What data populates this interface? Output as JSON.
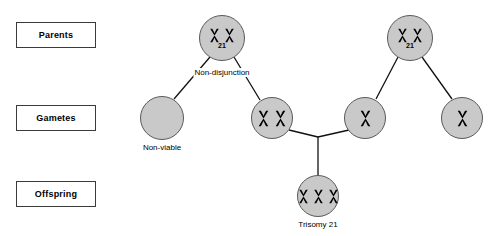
{
  "diagram": {
    "colors": {
      "cell_fill": "#c9c9c9",
      "cell_stroke": "#5a5a5a",
      "line": "#111111",
      "box_border": "#3a3a3a",
      "text": "#000000",
      "background": "#ffffff"
    },
    "row_labels": [
      {
        "id": "parents",
        "label": "Parents",
        "x": 16,
        "y": 22,
        "w": 80,
        "h": 26
      },
      {
        "id": "gametes",
        "label": "Gametes",
        "x": 16,
        "y": 105,
        "w": 80,
        "h": 26
      },
      {
        "id": "offspring",
        "label": "Offspring",
        "x": 16,
        "y": 181,
        "w": 80,
        "h": 26
      }
    ],
    "nodes": [
      {
        "id": "parent-left",
        "row": "parents",
        "chromosomes": 2,
        "number": "21",
        "caption": "",
        "cx": 222,
        "cy": 38,
        "r": 23,
        "chromo_size": 15
      },
      {
        "id": "parent-right",
        "row": "parents",
        "chromosomes": 2,
        "number": "21",
        "caption": "",
        "cx": 410,
        "cy": 38,
        "r": 23,
        "chromo_size": 15
      },
      {
        "id": "gamete-non-viable",
        "row": "gametes",
        "chromosomes": 0,
        "number": "",
        "caption": "Non-viable",
        "cx": 162,
        "cy": 118,
        "r": 22,
        "chromo_size": 15
      },
      {
        "id": "gamete-disomic",
        "row": "gametes",
        "chromosomes": 2,
        "number": "",
        "caption": "",
        "cx": 272,
        "cy": 118,
        "r": 21,
        "chromo_size": 17
      },
      {
        "id": "gamete-normal-inner",
        "row": "gametes",
        "chromosomes": 1,
        "number": "",
        "caption": "",
        "cx": 365,
        "cy": 118,
        "r": 21,
        "chromo_size": 17
      },
      {
        "id": "gamete-normal-outer",
        "row": "gametes",
        "chromosomes": 1,
        "number": "",
        "caption": "",
        "cx": 462,
        "cy": 118,
        "r": 21,
        "chromo_size": 17
      },
      {
        "id": "offspring-trisomy",
        "row": "offspring",
        "chromosomes": 3,
        "number": "",
        "caption": "Trisomy 21",
        "cx": 318,
        "cy": 196,
        "r": 21,
        "chromo_size": 15
      }
    ],
    "annotations": [
      {
        "id": "non-disjunction",
        "text": "Non-disjunction",
        "cx": 222,
        "cy": 73
      }
    ],
    "captions": [
      {
        "id": "non-viable-caption",
        "text": "Non-viable",
        "cx": 162,
        "cy": 148
      },
      {
        "id": "trisomy-caption",
        "text": "Trisomy 21",
        "cx": 318,
        "cy": 225
      }
    ],
    "edges": [
      {
        "id": "parent-left-to-non-viable",
        "x1": 210,
        "y1": 57,
        "x2": 174,
        "y2": 99
      },
      {
        "id": "parent-left-to-disomic",
        "x1": 234,
        "y1": 57,
        "x2": 260,
        "y2": 100
      },
      {
        "id": "parent-right-to-inner-gamete",
        "x1": 398,
        "y1": 57,
        "x2": 376,
        "y2": 99
      },
      {
        "id": "parent-right-to-outer-gamete",
        "x1": 422,
        "y1": 57,
        "x2": 452,
        "y2": 99
      },
      {
        "id": "disomic-to-junction",
        "x1": 289,
        "y1": 130,
        "x2": 318,
        "y2": 137
      },
      {
        "id": "inner-gamete-to-junction",
        "x1": 349,
        "y1": 130,
        "x2": 318,
        "y2": 137
      },
      {
        "id": "junction-to-offspring",
        "x1": 318,
        "y1": 137,
        "x2": 318,
        "y2": 175
      }
    ]
  }
}
